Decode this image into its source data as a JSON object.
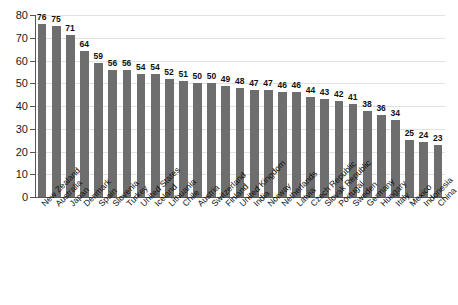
{
  "title_fragment": "",
  "colors": {
    "bar": "#6e6e6e",
    "grid": "#e2e2e2",
    "axis": "#555555",
    "text": "#111111",
    "background": "#ffffff"
  },
  "chart_data": {
    "type": "bar",
    "title": "",
    "subtitle": "",
    "xlabel": "",
    "ylabel": "",
    "ylim": [
      0,
      80
    ],
    "yticks": [
      0,
      10,
      20,
      30,
      40,
      50,
      60,
      70,
      80
    ],
    "grid": true,
    "legend": "none",
    "orientation": "vertical",
    "value_labels": true,
    "xtick_rotation": -45,
    "categories": [
      "New Zealand",
      "Australia",
      "Japan",
      "Denmark",
      "Spain",
      "Slovenia",
      "Turkey",
      "United States",
      "Iceland",
      "Lithuania",
      "Chile",
      "Austria",
      "Switzerland",
      "Finland",
      "United Kingdom",
      "India",
      "Norway",
      "Netherlands",
      "Latvia",
      "Czech Republic",
      "Slovak Republic",
      "Portugal",
      "Sweden",
      "Germany",
      "Hungary",
      "Italy",
      "Mexico",
      "Indonesia",
      "China"
    ],
    "values": [
      76,
      75,
      71,
      64,
      59,
      56,
      56,
      54,
      54,
      52,
      51,
      50,
      50,
      49,
      48,
      47,
      47,
      46,
      46,
      44,
      43,
      42,
      41,
      38,
      36,
      34,
      25,
      24,
      23
    ]
  }
}
